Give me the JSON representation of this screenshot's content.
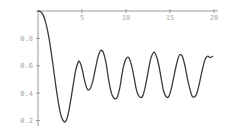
{
  "chart_data": {
    "type": "line",
    "title": "",
    "xlabel": "",
    "ylabel": "",
    "xlim": [
      0,
      20
    ],
    "ylim": [
      0.18,
      1.0
    ],
    "grid": false,
    "legend": null,
    "x_ticks": [
      5,
      10,
      15,
      20
    ],
    "x_tick_labels": [
      "5",
      "10",
      "15",
      "20"
    ],
    "y_ticks": [
      0.2,
      0.4,
      0.6,
      0.8
    ],
    "y_tick_labels": [
      "0.2",
      "0.4",
      "0.6",
      "0.8"
    ],
    "axes_origin": {
      "x": 0,
      "y": 1.0
    },
    "series": [
      {
        "name": "f(x)",
        "color": "#3a3a3a",
        "x": [
          0,
          0.3,
          0.6,
          0.9,
          1.2,
          1.5,
          1.8,
          2.1,
          2.4,
          2.7,
          3.0,
          3.2,
          3.4,
          3.7,
          4.0,
          4.3,
          4.6,
          4.8,
          5.0,
          5.3,
          5.6,
          5.9,
          6.2,
          6.5,
          6.8,
          7.1,
          7.4,
          7.7,
          7.9,
          8.1,
          8.4,
          8.7,
          9.0,
          9.3,
          9.5,
          9.7,
          10.0,
          10.3,
          10.6,
          10.9,
          11.1,
          11.3,
          11.6,
          11.9,
          12.2,
          12.5,
          12.7,
          12.9,
          13.2,
          13.5,
          13.8,
          14.1,
          14.3,
          14.5,
          14.8,
          15.1,
          15.4,
          15.7,
          15.9,
          16.1,
          16.4,
          16.7,
          17.0,
          17.3,
          17.5,
          17.7,
          18.0,
          18.3,
          18.6,
          18.9,
          19.1,
          19.3,
          19.6,
          19.9
        ],
        "y": [
          1.0,
          0.995,
          0.97,
          0.91,
          0.82,
          0.7,
          0.56,
          0.42,
          0.3,
          0.22,
          0.19,
          0.2,
          0.24,
          0.34,
          0.46,
          0.57,
          0.63,
          0.62,
          0.58,
          0.49,
          0.43,
          0.43,
          0.48,
          0.57,
          0.66,
          0.71,
          0.7,
          0.63,
          0.55,
          0.47,
          0.39,
          0.36,
          0.37,
          0.44,
          0.52,
          0.59,
          0.65,
          0.66,
          0.61,
          0.52,
          0.45,
          0.4,
          0.37,
          0.38,
          0.45,
          0.55,
          0.62,
          0.67,
          0.7,
          0.66,
          0.58,
          0.47,
          0.41,
          0.38,
          0.37,
          0.42,
          0.51,
          0.6,
          0.65,
          0.68,
          0.67,
          0.6,
          0.5,
          0.42,
          0.38,
          0.37,
          0.39,
          0.46,
          0.55,
          0.63,
          0.66,
          0.67,
          0.66,
          0.67
        ]
      }
    ]
  }
}
